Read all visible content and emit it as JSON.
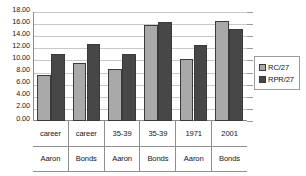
{
  "chart_data": {
    "type": "bar",
    "title": "",
    "subtitle": "",
    "xlabel": "",
    "ylabel": "",
    "ylim": [
      0,
      18
    ],
    "ytick_step": 2,
    "ytick_labels": [
      "18.00",
      "16.00",
      "14.00",
      "12.00",
      "10.00",
      "8.00",
      "6.00",
      "4.00",
      "2.00",
      "0.00"
    ],
    "ytick_values": [
      18,
      16,
      14,
      12,
      10,
      8,
      6,
      4,
      2,
      0
    ],
    "grid": true,
    "legend_position": "right",
    "categories": [
      {
        "top": "career",
        "bottom": "Aaron"
      },
      {
        "top": "career",
        "bottom": "Bonds"
      },
      {
        "top": "35-39",
        "bottom": "Aaron"
      },
      {
        "top": "35-39",
        "bottom": "Bonds"
      },
      {
        "top": "1971",
        "bottom": "Aaron"
      },
      {
        "top": "2001",
        "bottom": "Bonds"
      }
    ],
    "series": [
      {
        "name": "RC/27",
        "color": "#a9a9a9",
        "values": [
          7.6,
          9.6,
          8.6,
          15.9,
          10.3,
          16.5
        ]
      },
      {
        "name": "RPR/27",
        "color": "#474747",
        "values": [
          11.0,
          12.7,
          11.0,
          16.3,
          12.6,
          15.2
        ]
      }
    ]
  },
  "legend": {
    "entries": [
      {
        "label": "RC/27"
      },
      {
        "label": "RPR/27"
      }
    ]
  }
}
